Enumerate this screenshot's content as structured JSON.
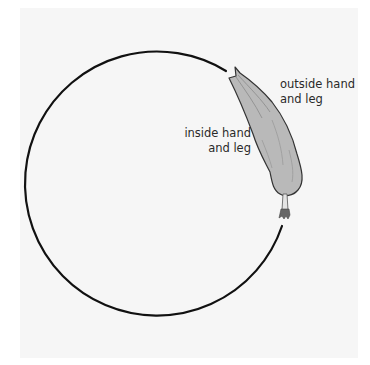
{
  "diagram": {
    "labels": {
      "outside": {
        "line1": "outside hand",
        "line2": "and leg"
      },
      "inside": {
        "line1": "inside hand",
        "line2": "and leg"
      }
    },
    "colors": {
      "background_panel": "#f6f6f6",
      "circle_stroke": "#111111",
      "figure_fill": "#b9b9b9",
      "figure_outline": "#333333",
      "label_text": "#2a2a2a"
    }
  }
}
